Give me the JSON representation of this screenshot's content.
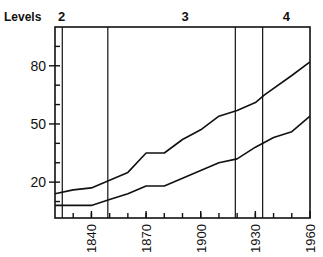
{
  "chart_data": {
    "type": "line",
    "title": "",
    "xlabel": "",
    "ylabel": "Levels",
    "xlim": [
      1820,
      1960
    ],
    "ylim": [
      1.5,
      100
    ],
    "grid": false,
    "x_ticks": [
      1840,
      1870,
      1900,
      1930,
      1960
    ],
    "x_minor_ticks_every": 10,
    "y_ticks": [
      20,
      50,
      80
    ],
    "y_minor_ticks_every": 10,
    "level_regions": [
      {
        "label": "2",
        "x_start": 1820,
        "x_end": 1849
      },
      {
        "label": "3",
        "x_start": 1849,
        "x_end": 1934
      },
      {
        "label": "4",
        "x_start": 1934,
        "x_end": 1960
      }
    ],
    "vertical_lines": [
      1824,
      1849,
      1919,
      1934
    ],
    "series": [
      {
        "name": "upper",
        "x": [
          1820,
          1830,
          1840,
          1850,
          1860,
          1870,
          1880,
          1890,
          1900,
          1910,
          1920,
          1930,
          1935,
          1950,
          1960
        ],
        "values": [
          14,
          16,
          17,
          21,
          25,
          35,
          35,
          42,
          47,
          54,
          57,
          61,
          65,
          75,
          82
        ]
      },
      {
        "name": "lower",
        "x": [
          1820,
          1840,
          1850,
          1860,
          1870,
          1880,
          1890,
          1900,
          1910,
          1920,
          1930,
          1940,
          1950,
          1960
        ],
        "values": [
          8,
          8,
          11,
          14,
          18,
          18,
          22,
          26,
          30,
          32,
          38,
          43,
          46,
          54
        ]
      }
    ]
  },
  "labels": {
    "y_axis_title": "Levels"
  }
}
